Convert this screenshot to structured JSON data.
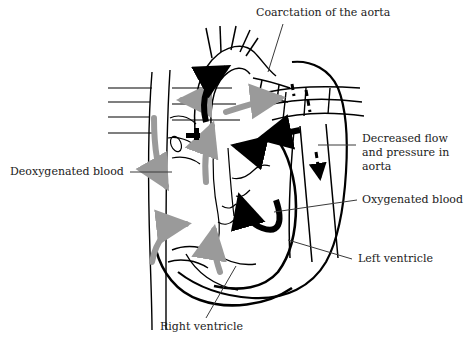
{
  "figure": {
    "type": "medical-anatomy-diagram",
    "subject": "Coarctation of the aorta",
    "width": 467,
    "height": 354,
    "background_color": "#ffffff"
  },
  "labels": {
    "coarctation": "Coarctation of the aorta",
    "deoxygenated": "Deoxygenated blood",
    "decreased_flow_line1": "Decreased flow",
    "decreased_flow_line2": "and pressure in",
    "decreased_flow_line3": "aorta",
    "oxygenated": "Oxygenated blood",
    "left_ventricle": "Left ventricle",
    "right_ventricle": "Right ventricle"
  },
  "caption": {
    "text": ""
  },
  "colors": {
    "outline": "#000000",
    "oxygenated_arrow": "#000000",
    "deoxygenated_arrow": "#9a9a9a",
    "text": "#1a1a1a",
    "leader_line": "#3a3a3a"
  },
  "flow_legend": [
    {
      "name": "oxygenated-blood",
      "color": "#000000",
      "style": "solid-arrow"
    },
    {
      "name": "deoxygenated-blood",
      "color": "#9a9a9a",
      "style": "solid-arrow"
    },
    {
      "name": "decreased-flow-aorta",
      "color": "#000000",
      "style": "dashed-arrow"
    }
  ]
}
